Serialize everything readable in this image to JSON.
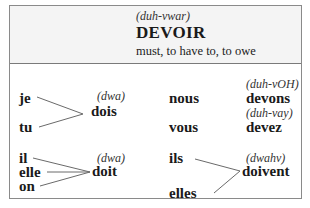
{
  "verb": {
    "pronunciation": "(duh-vwar)",
    "infinitive": "DEVOIR",
    "meaning": "must, to have to, to owe"
  },
  "conjugation": {
    "singular_1_2": {
      "pronouns": [
        "je",
        "tu"
      ],
      "form": "dois",
      "pronunciation": "(dwa)"
    },
    "singular_3": {
      "pronouns": [
        "il",
        "elle",
        "on"
      ],
      "form": "doit",
      "pronunciation": "(dwa)"
    },
    "nous": {
      "pronoun": "nous",
      "form": "devons",
      "pronunciation": "(duh-vOH)"
    },
    "vous": {
      "pronoun": "vous",
      "form": "devez",
      "pronunciation": "(duh-vay)"
    },
    "plural_3": {
      "pronouns": [
        "ils",
        "elles"
      ],
      "form": "doivent",
      "pronunciation": "(dwahv)"
    }
  },
  "colors": {
    "border": "#8a8a8a",
    "header_bg": "#f4f4f4",
    "text": "#1a1a1a",
    "lines": "#6a6a6a"
  }
}
